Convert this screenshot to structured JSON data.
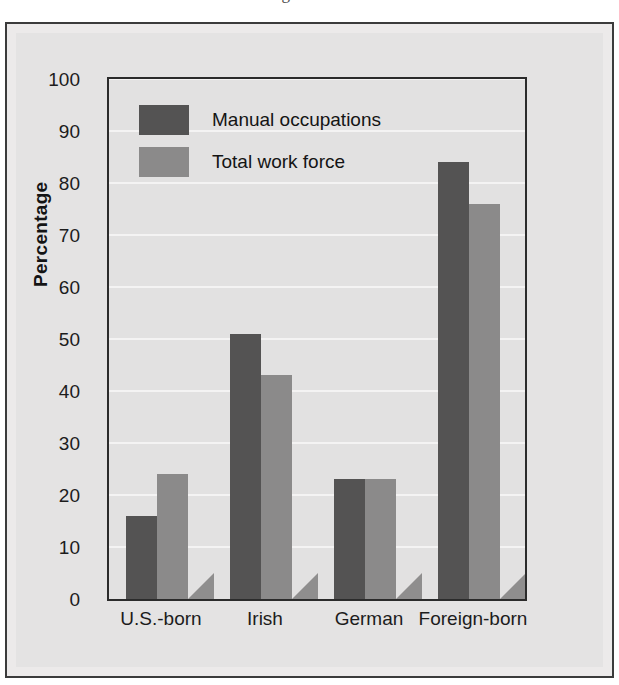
{
  "page": {
    "cropped_header_text": "and social environment for men of ages 15-19."
  },
  "chart_data": {
    "type": "bar",
    "title": "",
    "xlabel": "",
    "ylabel": "Percentage",
    "ylim": [
      0,
      100
    ],
    "ytick_step": 10,
    "yticks": [
      "100",
      "90",
      "80",
      "70",
      "60",
      "50",
      "40",
      "30",
      "20",
      "10",
      "0"
    ],
    "grid": true,
    "legend_position": "top-left",
    "categories": [
      "U.S.-born",
      "Irish",
      "German",
      "Foreign-born"
    ],
    "series": [
      {
        "name": "Manual occupations",
        "color": "#545353",
        "values": [
          16,
          51,
          23,
          84
        ]
      },
      {
        "name": "Total work force",
        "color": "#8b8a8a",
        "values": [
          24,
          43,
          23,
          76
        ]
      }
    ]
  },
  "colors": {
    "manual": "#545353",
    "total": "#8b8a8a",
    "plot_background": "#e2e1e1",
    "figure_background": "#e4e3e3",
    "axis": "#2b2b2b",
    "gridline": "#f4f3f3"
  }
}
